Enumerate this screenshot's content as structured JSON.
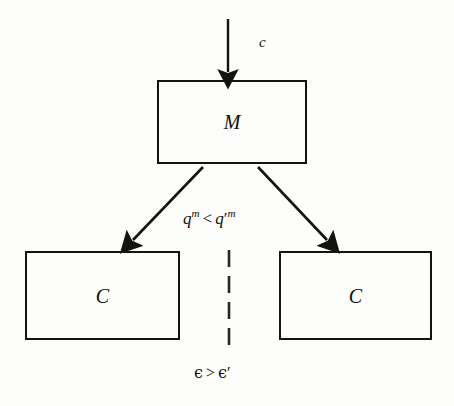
{
  "diagram": {
    "background_color": "#fdfdfc",
    "ink_color": "#15130f",
    "nodes": [
      {
        "id": "monopoly",
        "label": "M",
        "shape": "rectangle",
        "x": 157,
        "y": 80,
        "width": 150,
        "height": 84
      },
      {
        "id": "competitor-left",
        "label": "C",
        "shape": "rectangle",
        "x": 25,
        "y": 251,
        "width": 155,
        "height": 89
      },
      {
        "id": "competitor-right",
        "label": "C",
        "shape": "rectangle",
        "x": 279,
        "y": 251,
        "width": 153,
        "height": 89
      }
    ],
    "edges": [
      {
        "id": "input-arrow",
        "from": "external",
        "to": "monopoly",
        "style": "solid",
        "arrowhead": "filled-triangle",
        "x1": 228,
        "y1": 19,
        "x2": 228,
        "y2": 79
      },
      {
        "id": "split-left-arrow",
        "from": "monopoly",
        "to": "competitor-left",
        "style": "solid",
        "arrowhead": "filled-triangle",
        "x1": 203,
        "y1": 167,
        "x2": 128,
        "y2": 246
      },
      {
        "id": "split-right-arrow",
        "from": "monopoly",
        "to": "competitor-right",
        "style": "solid",
        "arrowhead": "filled-triangle",
        "x1": 258,
        "y1": 167,
        "x2": 332,
        "y2": 246
      },
      {
        "id": "divider",
        "from": "competitor-left",
        "to": "competitor-right",
        "style": "dashed",
        "arrowhead": "none",
        "x1": 229,
        "y1": 250,
        "x2": 229,
        "y2": 353
      }
    ],
    "labels": {
      "input": {
        "text": "c",
        "base": "c",
        "x": 259,
        "y": 35
      },
      "quantity_comparison": {
        "text": "q^m < q'^m",
        "left_base": "q",
        "left_sup": "m",
        "relation": "<",
        "right_base": "q",
        "right_prime": "′",
        "right_sup": "m",
        "x": 183,
        "y": 208
      },
      "markup_comparison": {
        "text": "ϵ > ϵ'",
        "left": "ϵ",
        "relation": ">",
        "right": "ϵ",
        "right_prime": "′",
        "x": 194,
        "y": 365
      }
    }
  }
}
